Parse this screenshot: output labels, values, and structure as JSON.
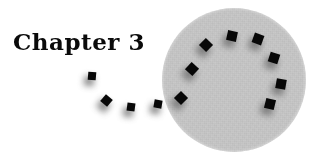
{
  "page": {
    "width": 330,
    "height": 164,
    "background_color": "#ffffff"
  },
  "title": {
    "text": "Chapter 3",
    "color": "#0a0a0a",
    "x": 13,
    "y": 29,
    "font_size_px": 23,
    "weight": "bold",
    "style": "serif"
  },
  "disc": {
    "name": "gray-disc",
    "center_x": 234,
    "center_y": 80,
    "radius": 72,
    "fill_color": "#c9c9c9",
    "texture": "grainy-noise"
  },
  "markers": {
    "square_color": "#080808",
    "shadow_color": "#6e6e6e",
    "shadow_offset_x": -3,
    "shadow_offset_y": 5,
    "shadow_blur_px": 3.2,
    "count": 14,
    "items": [
      {
        "id": "arc-1",
        "x": 181,
        "y": 98,
        "size": 10,
        "rotation": 45,
        "on_disc": true
      },
      {
        "id": "arc-2",
        "x": 192,
        "y": 69,
        "size": 10,
        "rotation": 42,
        "on_disc": true
      },
      {
        "id": "arc-3",
        "x": 206,
        "y": 45,
        "size": 10,
        "rotation": 44,
        "on_disc": true
      },
      {
        "id": "arc-4",
        "x": 232,
        "y": 36,
        "size": 10,
        "rotation": 12,
        "on_disc": true
      },
      {
        "id": "arc-5",
        "x": 258,
        "y": 39,
        "size": 10,
        "rotation": 20,
        "on_disc": true
      },
      {
        "id": "arc-6",
        "x": 274,
        "y": 58,
        "size": 10,
        "rotation": 18,
        "on_disc": true
      },
      {
        "id": "arc-7",
        "x": 281,
        "y": 84,
        "size": 10,
        "rotation": 10,
        "on_disc": true
      },
      {
        "id": "arc-8",
        "x": 270,
        "y": 104,
        "size": 10,
        "rotation": 14,
        "on_disc": true
      },
      {
        "id": "trail-1",
        "x": 158,
        "y": 104,
        "size": 8,
        "rotation": 10,
        "on_disc": false
      },
      {
        "id": "trail-2",
        "x": 131,
        "y": 107,
        "size": 8,
        "rotation": 8,
        "on_disc": false
      },
      {
        "id": "trail-3",
        "x": 106,
        "y": 100,
        "size": 9,
        "rotation": 40,
        "on_disc": false
      },
      {
        "id": "trail-4",
        "x": 92,
        "y": 76,
        "size": 8,
        "rotation": 5,
        "on_disc": false
      }
    ]
  }
}
